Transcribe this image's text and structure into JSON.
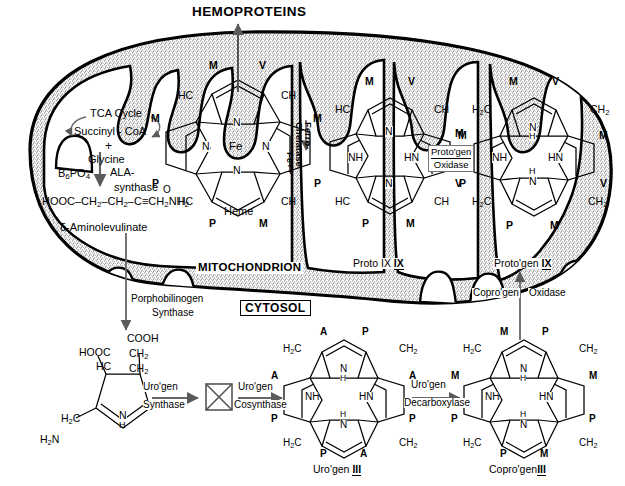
{
  "figure": {
    "compartments": {
      "mitochondrion": "MITOCHONDRION",
      "cytosol": "CYTOSOL"
    },
    "output": "HEMOPROTEINS"
  },
  "mito_pathway": {
    "tca": "TCA  Cycle",
    "succinyl": "Succinyl - CoA",
    "plus": "+",
    "glycine": "Glycine",
    "cofactor_b6": "B",
    "cofactor_b6_sub": "6",
    "cofactor_b6_tail": "PO",
    "cofactor_b6_tail_sub": "4",
    "enzyme_ala_1": "ALA-",
    "enzyme_ala_2": "synthase",
    "ala_chain": "HOOC - CH2 - CH2 - C = CH2NH2",
    "ala_oxygen": "O",
    "ala_name": "δ-Aminolevulinate"
  },
  "enzymes": {
    "ferrochelatase_1": "Ferro-",
    "ferrochelatase_2": "Chelatase",
    "ferrochelatase_3": "Fe++",
    "protogen_oxidase_1": "Proto'gen",
    "protogen_oxidase_2": "Oxidase",
    "coprogen_oxidase_1": "Copro'gen",
    "coprogen_oxidase_2": "Oxidase",
    "porphobilinogen_synthase_1": "Porphobilinogen",
    "porphobilinogen_synthase_2": "Synthase",
    "urogen_synthase_1": "Uro'gen",
    "urogen_synthase_2": "Synthase",
    "urogen_cosynthase_1": "Uro'gen",
    "urogen_cosynthase_2": "Cosynthase",
    "urogen_decarboxylase_1": "Uro'gen",
    "urogen_decarboxylase_2": "Decarboxylase"
  },
  "structures": {
    "heme": {
      "name": "Heme",
      "metal": "Fe",
      "top": [
        "M",
        "V"
      ],
      "meso": [
        "HC",
        "CH",
        "HC",
        "CH"
      ],
      "sides": [
        "M",
        "M",
        "P",
        "P"
      ],
      "inner": [
        "N",
        "N",
        "N",
        "N"
      ],
      "bottom": [
        "P",
        "M"
      ]
    },
    "proto_ix": {
      "name": "Proto IX",
      "numeral": "IX",
      "top": [
        "M",
        "V"
      ],
      "meso": [
        "HC",
        "CH",
        "HC",
        "CH"
      ],
      "sides": [
        "M",
        "V",
        "P",
        "M"
      ],
      "inner": [
        "N",
        "NH",
        "HN",
        "N"
      ],
      "bottom": [
        "P",
        "M"
      ]
    },
    "protogen_ix": {
      "name": "Proto'gen",
      "numeral": "IX",
      "top": [
        "M",
        "V"
      ],
      "meso": [
        "H2C",
        "CH2",
        "H2C",
        "CH2"
      ],
      "sides": [
        "M",
        "M",
        "P",
        "V"
      ],
      "inner": [
        "N",
        "NH",
        "HN",
        "N"
      ],
      "inner_h": [
        "H",
        "H"
      ],
      "bottom": [
        "P",
        "M"
      ]
    },
    "urogen_iii": {
      "name": "Uro'gen",
      "numeral": "III",
      "top": [
        "A",
        "P"
      ],
      "meso": [
        "H2C",
        "CH2",
        "H2C",
        "CH2"
      ],
      "sides": [
        "A",
        "A",
        "P",
        "P"
      ],
      "inner": [
        "N",
        "NH",
        "HN",
        "N"
      ],
      "inner_h": [
        "H",
        "H"
      ],
      "bottom": [
        "P",
        "A"
      ]
    },
    "coprogen_iii": {
      "name": "Copro'gen",
      "numeral": "III",
      "top": [
        "M",
        "P"
      ],
      "meso": [
        "H2C",
        "CH2",
        "H2C",
        "CH2"
      ],
      "sides": [
        "M",
        "M",
        "P",
        "P"
      ],
      "inner": [
        "N",
        "NH",
        "HN",
        "N"
      ],
      "inner_h": [
        "H",
        "H"
      ],
      "bottom": [
        "P",
        "M"
      ]
    },
    "porphobilinogen": {
      "top_right": [
        "COOH",
        "CH2",
        "CH2"
      ],
      "top_left": [
        "HOOC",
        "HC"
      ],
      "bottom_left": [
        "H2C",
        "H2N"
      ],
      "ring_n": "N",
      "ring_h": "H"
    }
  },
  "colors": {
    "ink": "#000000",
    "arrow": "#555555",
    "stipple": "#9a9a9a",
    "paper": "#ffffff"
  }
}
